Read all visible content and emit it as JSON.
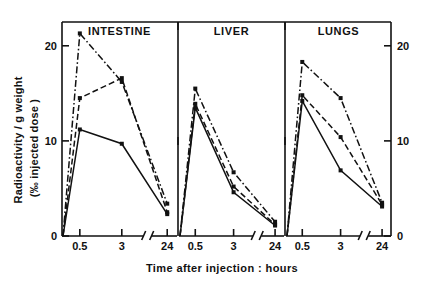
{
  "figure": {
    "ylabel_line1": "Radioactivity / g weight",
    "ylabel_line2": "(‰ injected dose )",
    "xlabel": "Time  after  injection : hours"
  },
  "chart_data": {
    "type": "line",
    "title": "",
    "subtitle": "",
    "xlabel": "Time after injection: hours",
    "ylabel": "Radioactivity / g weight (‰ injected dose)",
    "ylim": [
      0,
      22.5
    ],
    "y_ticks": [
      0,
      10,
      20
    ],
    "y_ticklabels": [
      "0",
      "10",
      "20"
    ],
    "x_ticks": [
      "0.5",
      "3",
      "24"
    ],
    "x_ticklabels": [
      "0.5",
      "3",
      "24"
    ],
    "x_axis_broken": true,
    "x_break_between": [
      "3",
      "24"
    ],
    "grid": false,
    "legend": "none",
    "dual_y_axis": true,
    "panels": [
      {
        "name": "INTESTINE",
        "x": [
          0.5,
          3,
          24
        ],
        "series": [
          {
            "name": "series-1",
            "linestyle": "dash-dot",
            "marker": "square",
            "values": [
              21.3,
              16.2,
              3.4
            ]
          },
          {
            "name": "series-2",
            "linestyle": "dashed",
            "marker": "square",
            "values": [
              14.5,
              16.6,
              2.5
            ]
          },
          {
            "name": "series-3",
            "linestyle": "solid",
            "marker": "square",
            "values": [
              11.2,
              9.7,
              2.3
            ]
          }
        ]
      },
      {
        "name": "LIVER",
        "x": [
          0.5,
          3,
          24
        ],
        "series": [
          {
            "name": "series-1",
            "linestyle": "dash-dot",
            "marker": "square",
            "values": [
              15.5,
              6.7,
              1.5
            ]
          },
          {
            "name": "series-2",
            "linestyle": "dashed",
            "marker": "square",
            "values": [
              13.9,
              5.2,
              1.2
            ]
          },
          {
            "name": "series-3",
            "linestyle": "solid",
            "marker": "square",
            "values": [
              13.5,
              4.6,
              1.1
            ]
          }
        ]
      },
      {
        "name": "LUNGS",
        "x": [
          0.5,
          3,
          24
        ],
        "series": [
          {
            "name": "series-1",
            "linestyle": "dash-dot",
            "marker": "square",
            "values": [
              18.3,
              14.5,
              3.5
            ]
          },
          {
            "name": "series-2",
            "linestyle": "dashed",
            "marker": "square",
            "values": [
              14.8,
              10.4,
              3.3
            ]
          },
          {
            "name": "series-3",
            "linestyle": "solid",
            "marker": "square",
            "values": [
              14.2,
              6.9,
              3.1
            ]
          }
        ]
      }
    ]
  }
}
